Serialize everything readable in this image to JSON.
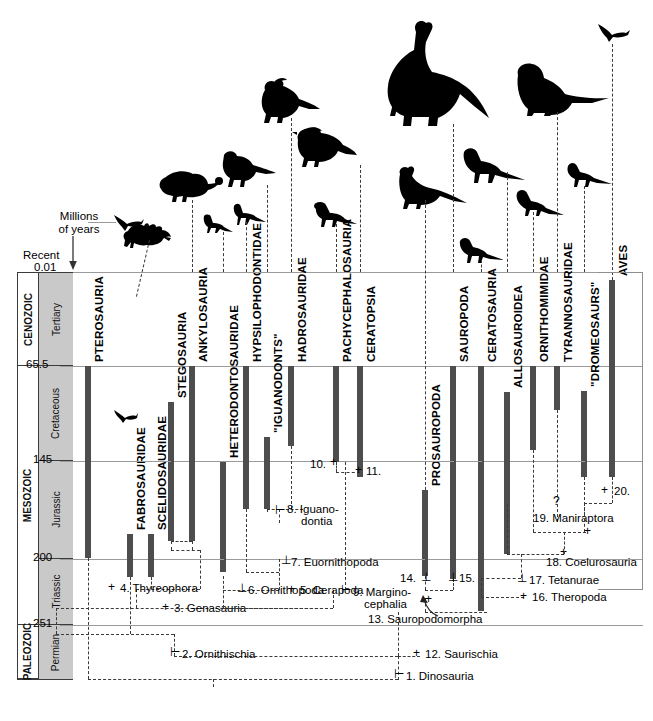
{
  "figure": {
    "type": "cladogram-timescale",
    "axis": {
      "title_line1": "Millions",
      "title_line2": "of years",
      "recent_label": "Recent",
      "recent_value": "0.01",
      "ticks": [
        "0.01",
        "65.5",
        "145",
        "200",
        "251"
      ]
    },
    "eras": [
      {
        "name": "CENOZOIC"
      },
      {
        "name": "MESOZOIC"
      },
      {
        "name": "PALEOZOIC"
      }
    ],
    "periods": [
      {
        "name": "Tertiary"
      },
      {
        "name": "Cretaceous"
      },
      {
        "name": "Jurassic"
      },
      {
        "name": "Triassic"
      },
      {
        "name": "Permian"
      }
    ]
  },
  "taxa": [
    {
      "label": "PTEROSAURIA",
      "silhouette": "pterosaur"
    },
    {
      "label": "FABROSAURIDAE",
      "silhouette": "none"
    },
    {
      "label": "SCELIDOSAURIDAE",
      "silhouette": "none"
    },
    {
      "label": "STEGOSAURIA",
      "silhouette": "stegosaur"
    },
    {
      "label": "ANKYLOSAURIA",
      "silhouette": "ankylosaur"
    },
    {
      "label": "HETERODONTOSAURIDAE",
      "silhouette": "heterodontosaur"
    },
    {
      "label": "HYPSILOPHODONTIDAE",
      "silhouette": "hypsilophodont"
    },
    {
      "label": "\"IGUANODONTS\"",
      "silhouette": "iguanodont"
    },
    {
      "label": "HADROSAURIDAE",
      "silhouette": "hadrosaur"
    },
    {
      "label": "PACHYCEPHALOSAURIA",
      "silhouette": "pachycephalosaur"
    },
    {
      "label": "CERATOPSIA",
      "silhouette": "ceratopsian"
    },
    {
      "label": "PROSAUROPODA",
      "silhouette": "prosauropod"
    },
    {
      "label": "SAUROPODA",
      "silhouette": "sauropod"
    },
    {
      "label": "CERATOSAURIA",
      "silhouette": "ceratosaur"
    },
    {
      "label": "ALLOSAUROIDEA",
      "silhouette": "allosaur"
    },
    {
      "label": "ORNITHOMIMIDAE",
      "silhouette": "ornithomimid"
    },
    {
      "label": "TYRANNOSAURIDAE",
      "silhouette": "tyrannosaur"
    },
    {
      "label": "\"DROMEOSAURS\"",
      "silhouette": "dromaeosaur"
    },
    {
      "label": "AVES",
      "silhouette": "bird"
    }
  ],
  "nodes": [
    {
      "n": "1.",
      "name": "Dinosauria"
    },
    {
      "n": "2.",
      "name": "Ornithischia"
    },
    {
      "n": "3.",
      "name": "Genasauria"
    },
    {
      "n": "4.",
      "name": "Thyreophora"
    },
    {
      "n": "5.",
      "name": "Cerapoda"
    },
    {
      "n": "6.",
      "name": "Ornithopoda"
    },
    {
      "n": "7.",
      "name": "Euornithopoda"
    },
    {
      "n": "8.",
      "name": "Iguano-\ndontia"
    },
    {
      "n": "9.",
      "name": "Margino-\ncephalia"
    },
    {
      "n": "10.",
      "name": ""
    },
    {
      "n": "11.",
      "name": ""
    },
    {
      "n": "12.",
      "name": "Saurischia"
    },
    {
      "n": "13.",
      "name": "Sauropodomorpha"
    },
    {
      "n": "14.",
      "name": ""
    },
    {
      "n": "15.",
      "name": ""
    },
    {
      "n": "16.",
      "name": "Theropoda"
    },
    {
      "n": "17.",
      "name": "Tetanurae"
    },
    {
      "n": "18.",
      "name": "Coelurosauria"
    },
    {
      "n": "19.",
      "name": "Maniraptora"
    },
    {
      "n": "20.",
      "name": ""
    }
  ],
  "node_text": {
    "n1": "1. Dinosauria",
    "n2": "2. Ornithischia",
    "n3": "3. Genasauria",
    "n4": "4. Thyreophora",
    "n5": "5. Cerapoda",
    "n6": "6. Ornithopoda",
    "n7": "7. Euornithopoda",
    "n8a": "8. Iguano-",
    "n8b": "dontia",
    "n9a": "9. Margino-",
    "n9b": "cephalia",
    "n10": "10.",
    "n11": "11.",
    "n12": "12. Saurischia",
    "n13": "13. Sauropodomorpha",
    "n14": "14.",
    "n15": "15.",
    "n16": "16. Theropoda",
    "n17": "17. Tetanurae",
    "n18": "18. Coelurosauria",
    "n19": "19. Maniraptora",
    "n20": "20.",
    "uncertain": "?"
  },
  "colors": {
    "bar": "#4d4d4d",
    "period_fill": "#c9c9c9",
    "rule": "#9a9a9a",
    "text": "#000000"
  }
}
